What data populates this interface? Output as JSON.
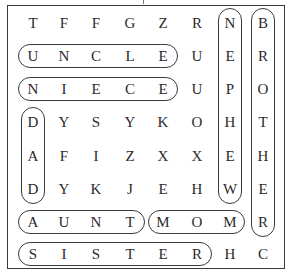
{
  "puzzle": {
    "title": "Family word search",
    "grid": [
      [
        "T",
        "F",
        "F",
        "G",
        "Z",
        "R",
        "N",
        "B"
      ],
      [
        "U",
        "N",
        "C",
        "L",
        "E",
        "U",
        "E",
        "R"
      ],
      [
        "N",
        "I",
        "E",
        "C",
        "E",
        "U",
        "P",
        "O"
      ],
      [
        "D",
        "Y",
        "S",
        "Y",
        "K",
        "O",
        "H",
        "T"
      ],
      [
        "A",
        "F",
        "I",
        "Z",
        "X",
        "X",
        "E",
        "H"
      ],
      [
        "D",
        "Y",
        "K",
        "J",
        "E",
        "H",
        "W",
        "E"
      ],
      [
        "A",
        "U",
        "N",
        "T",
        "M",
        "O",
        "M",
        "R"
      ],
      [
        "S",
        "I",
        "S",
        "T",
        "E",
        "R",
        "H",
        "C"
      ]
    ],
    "found_words": [
      {
        "word": "UNCLE",
        "direction": "horizontal",
        "row": 1,
        "col": 0,
        "length": 5
      },
      {
        "word": "NIECE",
        "direction": "horizontal",
        "row": 2,
        "col": 0,
        "length": 5
      },
      {
        "word": "DAD",
        "direction": "vertical",
        "row": 3,
        "col": 0,
        "length": 3
      },
      {
        "word": "NEPHEW",
        "direction": "vertical",
        "row": 0,
        "col": 6,
        "length": 6
      },
      {
        "word": "BROTHER",
        "direction": "vertical",
        "row": 0,
        "col": 7,
        "length": 7
      },
      {
        "word": "AUNT",
        "direction": "horizontal",
        "row": 6,
        "col": 0,
        "length": 4
      },
      {
        "word": "MOM",
        "direction": "horizontal",
        "row": 6,
        "col": 4,
        "length": 3
      },
      {
        "word": "SISTER",
        "direction": "horizontal",
        "row": 7,
        "col": 0,
        "length": 6
      }
    ]
  },
  "colors": {
    "border": "#3a3a3a",
    "text": "#2b2b2b",
    "background": "#ffffff"
  }
}
